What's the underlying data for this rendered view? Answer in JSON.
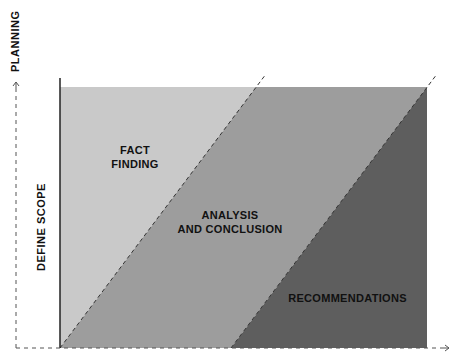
{
  "diagram": {
    "y_axis_label": "PLANNING",
    "x_axis_side_label": "DEFINE SCOPE",
    "regions": [
      {
        "id": "fact-finding",
        "label_line1": "FACT",
        "label_line2": "FINDING",
        "color": "#c9c9c9"
      },
      {
        "id": "analysis",
        "label_line1": "ANALYSIS",
        "label_line2": "AND CONCLUSION",
        "color": "#9d9d9d"
      },
      {
        "id": "recommendations",
        "label_line1": "RECOMMENDATIONS",
        "color": "#5e5e5e"
      }
    ],
    "arrows": {
      "x_axis_arrow": "→",
      "y_axis_arrow": "→"
    }
  }
}
